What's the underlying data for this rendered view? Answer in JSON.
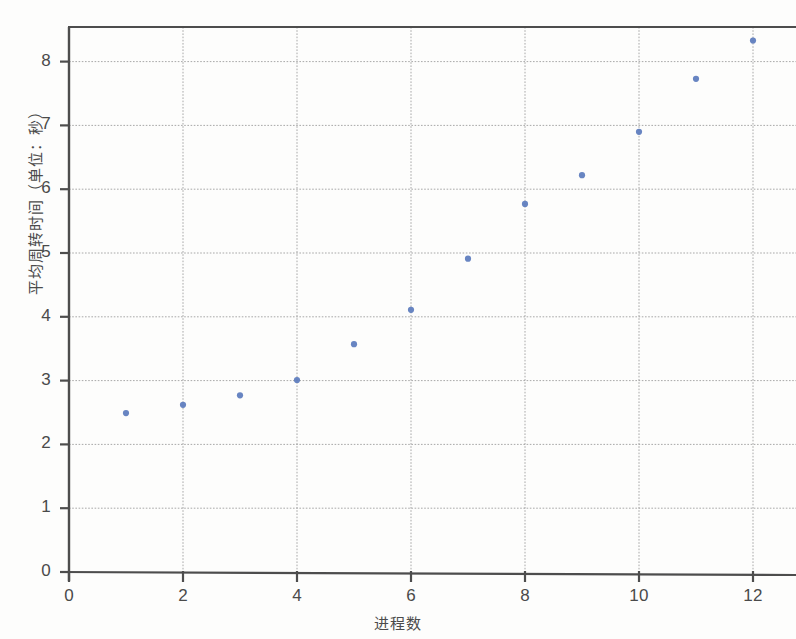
{
  "chart_data": {
    "type": "scatter",
    "title": "",
    "xlabel": "进程数",
    "ylabel": "平均周转时间（单位：秒）",
    "xlim": [
      0,
      12.8
    ],
    "ylim": [
      0,
      8.8
    ],
    "xticks": [
      "0",
      "2",
      "4",
      "6",
      "8",
      "10",
      "12"
    ],
    "xtick_values": [
      0,
      2,
      4,
      6,
      8,
      10,
      12
    ],
    "yticks": [
      "0",
      "1",
      "2",
      "3",
      "4",
      "5",
      "6",
      "7",
      "8"
    ],
    "ytick_values": [
      0,
      1,
      2,
      3,
      4,
      5,
      6,
      7,
      8
    ],
    "grid": true,
    "grid_style": "dashed",
    "legend": null,
    "marker_color": "#5b7bbd",
    "marker_size": 5,
    "axis_color": "#4d4d4d",
    "grid_color": "#9a9a9a",
    "x": [
      1,
      2,
      3,
      4,
      5,
      6,
      7,
      8,
      9,
      10,
      11,
      12
    ],
    "values": [
      2.49,
      2.62,
      2.77,
      3.01,
      3.57,
      4.11,
      4.91,
      5.77,
      6.22,
      6.9,
      7.73,
      8.33
    ],
    "series": [
      {
        "name": "平均周转时间",
        "points": [
          {
            "x": 1,
            "y": 2.49
          },
          {
            "x": 2,
            "y": 2.62
          },
          {
            "x": 3,
            "y": 2.77
          },
          {
            "x": 4,
            "y": 3.01
          },
          {
            "x": 5,
            "y": 3.57
          },
          {
            "x": 6,
            "y": 4.11
          },
          {
            "x": 7,
            "y": 4.91
          },
          {
            "x": 8,
            "y": 5.77
          },
          {
            "x": 9,
            "y": 6.22
          },
          {
            "x": 10,
            "y": 6.9
          },
          {
            "x": 11,
            "y": 7.73
          },
          {
            "x": 12,
            "y": 8.33
          }
        ]
      }
    ]
  }
}
